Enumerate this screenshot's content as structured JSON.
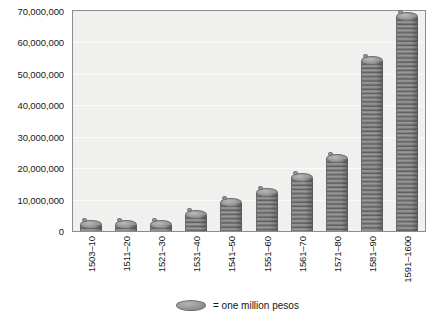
{
  "chart_data": {
    "type": "bar",
    "title": "",
    "subtitle": "",
    "xlabel": "",
    "ylabel": "",
    "categories": [
      "1503–10",
      "1511–20",
      "1521–30",
      "1531–40",
      "1541–50",
      "1551–60",
      "1561–70",
      "1571–80",
      "1581–90",
      "1591–1600"
    ],
    "values": [
      1000000,
      2000000,
      1000000,
      5000000,
      9000000,
      12000000,
      17000000,
      23000000,
      54000000,
      68000000
    ],
    "ylim": [
      0,
      70000000
    ],
    "yticks": [
      0,
      10000000,
      20000000,
      30000000,
      40000000,
      50000000,
      60000000,
      70000000
    ],
    "ytick_labels": [
      "0",
      "10,000,000",
      "20,000,000",
      "30,000,000",
      "40,000,000",
      "50,000,000",
      "60,000,000",
      "70,000,000"
    ],
    "grid": true,
    "legend_position": "bottom-center",
    "legend": [
      {
        "marker": "coin-ellipse",
        "label": "= one million pesos"
      }
    ],
    "unit_note": "Each coin in a stack represents one million pesos",
    "series_color": "#8c8c8c",
    "plot_background": "#f0f0ee",
    "plot_border": "#8d8d8d",
    "gridline_color": "#fbfbfa"
  },
  "legend": {
    "coin_name": "coin-ellipse",
    "text": "= one million pesos"
  }
}
